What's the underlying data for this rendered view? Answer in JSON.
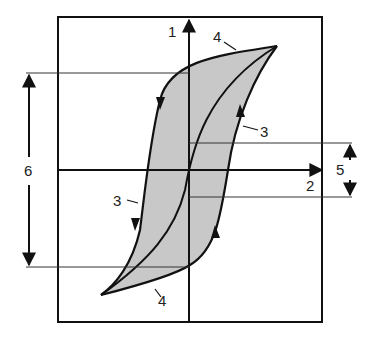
{
  "diagram": {
    "type": "hysteresis-loop",
    "labels": {
      "vertical_axis": "1",
      "horizontal_axis": "2",
      "branch_marker_right": "3",
      "branch_marker_left": "3",
      "outer_loop_top": "4",
      "outer_loop_bottom": "4",
      "coercive_span": "5",
      "remanence_span": "6"
    },
    "colors": {
      "line": "#111111",
      "fill": "#c8c8c8",
      "guide": "#333333"
    }
  }
}
